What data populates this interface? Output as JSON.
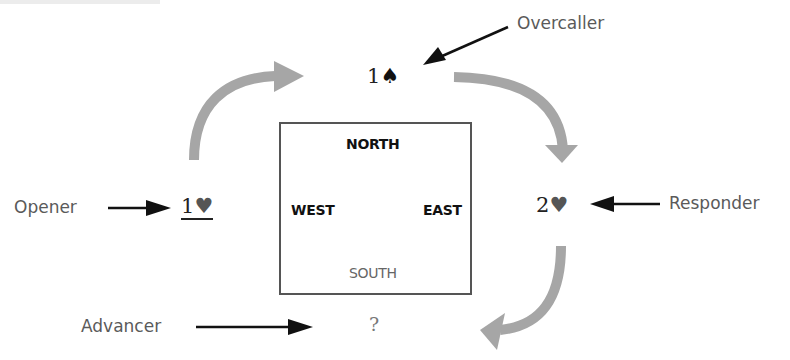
{
  "diagram": {
    "title_fragment": "",
    "table": {
      "north": "NORTH",
      "west": "WEST",
      "east": "EAST",
      "south": "SOUTH"
    },
    "bids": {
      "opener": {
        "level": "1",
        "suit": "♥"
      },
      "overcaller": {
        "level": "1",
        "suit": "♠"
      },
      "responder": {
        "level": "2",
        "suit": "♥"
      },
      "advancer": {
        "level": "?",
        "suit": ""
      }
    },
    "roles": {
      "opener": "Opener",
      "overcaller": "Overcaller",
      "responder": "Responder",
      "advancer": "Advancer"
    },
    "colors": {
      "flow_arrow": "#a6a6a6",
      "pointer_arrow": "#111111",
      "box_border": "#555555",
      "role_text": "#5a5a5a"
    }
  }
}
